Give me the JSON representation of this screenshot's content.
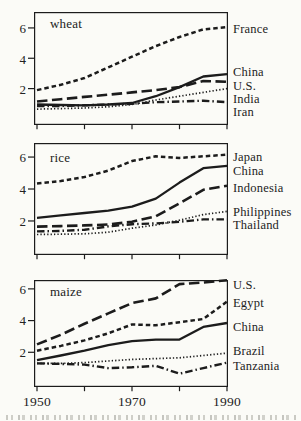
{
  "figure": {
    "background": "#fbfbf7",
    "ink": "#1c1c1c",
    "x_axis": {
      "tick_labels": [
        "1950",
        "1970",
        "1990"
      ],
      "minor_ticks": [
        1950,
        1960,
        1970,
        1980,
        1990
      ],
      "range": [
        1950,
        1990
      ]
    }
  },
  "chart_data": [
    {
      "type": "line",
      "title": "wheat",
      "x": [
        1950,
        1955,
        1960,
        1965,
        1970,
        1975,
        1980,
        1985,
        1990
      ],
      "ylim": [
        -0.4,
        7.05
      ],
      "yticks": [
        2,
        4,
        6
      ],
      "grid": false,
      "legend_position": "right-outside",
      "series": [
        {
          "name": "France",
          "style": "short-dash",
          "label_y_px": 29,
          "values": [
            1.9,
            2.25,
            2.7,
            3.4,
            4.1,
            4.8,
            5.4,
            5.9,
            6.05
          ]
        },
        {
          "name": "China",
          "style": "solid",
          "label_y_px": 72,
          "values": [
            0.95,
            0.92,
            0.9,
            0.95,
            1.05,
            1.5,
            2.1,
            2.8,
            2.95
          ]
        },
        {
          "name": "U.S.",
          "style": "long-dash",
          "label_y_px": 85.5,
          "values": [
            1.15,
            1.3,
            1.45,
            1.6,
            1.75,
            1.9,
            2.1,
            2.5,
            2.45
          ]
        },
        {
          "name": "India",
          "style": "dotted",
          "label_y_px": 99,
          "values": [
            0.65,
            0.68,
            0.72,
            0.8,
            0.95,
            1.25,
            1.5,
            1.75,
            2.0
          ]
        },
        {
          "name": "Iran",
          "style": "dash-dot",
          "label_y_px": 112,
          "values": [
            0.85,
            0.85,
            0.9,
            0.95,
            1.0,
            1.1,
            1.15,
            1.2,
            1.1
          ]
        }
      ]
    },
    {
      "type": "line",
      "title": "rice",
      "x": [
        1950,
        1955,
        1960,
        1965,
        1970,
        1975,
        1980,
        1985,
        1990
      ],
      "ylim": [
        -0.13,
        6.88
      ],
      "yticks": [
        2,
        4,
        6
      ],
      "grid": false,
      "legend_position": "right-outside",
      "series": [
        {
          "name": "Japan",
          "style": "short-dash",
          "label_y_px": 157,
          "values": [
            4.35,
            4.5,
            4.75,
            5.15,
            5.75,
            6.05,
            5.95,
            6.05,
            6.15
          ]
        },
        {
          "name": "China",
          "style": "solid",
          "label_y_px": 171,
          "values": [
            2.2,
            2.35,
            2.5,
            2.65,
            2.9,
            3.4,
            4.4,
            5.3,
            5.45
          ]
        },
        {
          "name": "Indonesia",
          "style": "long-dash",
          "label_y_px": 188,
          "values": [
            1.65,
            1.68,
            1.72,
            1.78,
            1.95,
            2.3,
            3.1,
            3.95,
            4.2
          ]
        },
        {
          "name": "Philippines",
          "style": "dotted",
          "label_y_px": 212,
          "values": [
            1.15,
            1.17,
            1.2,
            1.3,
            1.55,
            1.75,
            2.05,
            2.4,
            2.6
          ]
        },
        {
          "name": "Thailand",
          "style": "dash-dot",
          "label_y_px": 225,
          "values": [
            1.35,
            1.38,
            1.45,
            1.66,
            1.8,
            1.85,
            1.95,
            2.1,
            2.1
          ]
        }
      ]
    },
    {
      "type": "line",
      "title": "maize",
      "x": [
        1950,
        1955,
        1960,
        1965,
        1970,
        1975,
        1980,
        1985,
        1990
      ],
      "ylim": [
        -0.19,
        6.56
      ],
      "yticks": [
        2,
        4,
        6
      ],
      "grid": false,
      "legend_position": "right-outside",
      "series": [
        {
          "name": "U.S.",
          "style": "long-dash",
          "label_y_px": 285,
          "values": [
            2.5,
            3.1,
            3.8,
            4.45,
            5.1,
            5.4,
            6.3,
            6.4,
            6.55
          ]
        },
        {
          "name": "Egypt",
          "style": "short-dash",
          "label_y_px": 303,
          "values": [
            2.1,
            2.4,
            2.75,
            3.2,
            3.75,
            3.7,
            3.9,
            4.1,
            5.2
          ]
        },
        {
          "name": "China",
          "style": "solid",
          "label_y_px": 327,
          "values": [
            1.5,
            1.8,
            2.1,
            2.45,
            2.7,
            2.8,
            2.8,
            3.6,
            3.85
          ]
        },
        {
          "name": "Brazil",
          "style": "dotted",
          "label_y_px": 351,
          "values": [
            1.3,
            1.3,
            1.35,
            1.45,
            1.55,
            1.6,
            1.65,
            1.8,
            1.95
          ]
        },
        {
          "name": "Tanzania",
          "style": "dash-dot",
          "label_y_px": 366,
          "values": [
            1.3,
            1.27,
            1.22,
            1.0,
            1.05,
            1.15,
            0.65,
            1.0,
            1.35
          ]
        }
      ]
    }
  ]
}
